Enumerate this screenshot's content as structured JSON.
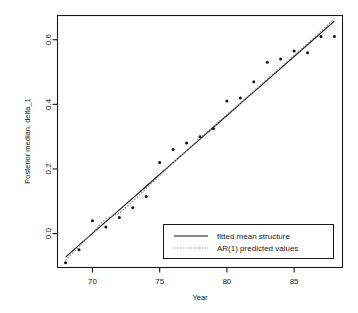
{
  "chart_data": {
    "type": "scatter",
    "title": "",
    "xlabel": "Year",
    "ylabel": "Posterior median, delta_1",
    "xlim": [
      67.4,
      88.6
    ],
    "ylim": [
      -0.105,
      0.675
    ],
    "xticks": [
      70,
      75,
      80,
      85
    ],
    "xticklabels": [
      "70",
      "75",
      "80",
      "85"
    ],
    "yticks": [
      0.0,
      0.2,
      0.4,
      0.6
    ],
    "yticklabels": [
      "0.0",
      "0.2",
      "0.4",
      "0.6"
    ],
    "grid": false,
    "legend_position": "bottom-right",
    "x": [
      68,
      69,
      70,
      71,
      72,
      73,
      74,
      75,
      76,
      77,
      78,
      79,
      80,
      81,
      82,
      83,
      84,
      85,
      86,
      87,
      88
    ],
    "series": [
      {
        "name": "Posterior median, delta_1",
        "kind": "points",
        "values": [
          -0.09,
          -0.05,
          0.04,
          0.02,
          0.05,
          0.08,
          0.115,
          0.22,
          0.26,
          0.28,
          0.3,
          0.325,
          0.41,
          0.42,
          0.47,
          0.53,
          0.54,
          0.565,
          0.56,
          0.61,
          0.61
        ]
      },
      {
        "name": "fitted mean structure",
        "kind": "line",
        "style": "solid",
        "color": "#111111",
        "values": [
          -0.073,
          -0.036,
          0.0005,
          0.037,
          0.0735,
          0.11,
          0.1465,
          0.183,
          0.2195,
          0.256,
          0.2925,
          0.329,
          0.3655,
          0.402,
          0.4385,
          0.475,
          0.5115,
          0.548,
          0.5845,
          0.621,
          0.6575
        ]
      },
      {
        "name": "AR(1) predicted values",
        "kind": "line",
        "style": "dotted",
        "color": "#8a8a8a",
        "values": [
          -0.083,
          -0.04,
          0.003,
          0.046,
          0.063,
          0.1,
          0.14,
          0.18,
          0.219,
          0.257,
          0.295,
          0.331,
          0.368,
          0.404,
          0.441,
          0.478,
          0.515,
          0.551,
          0.588,
          0.626,
          0.665
        ]
      }
    ],
    "legend": [
      {
        "label": "fitted mean structure",
        "style": "solid",
        "color": "#111111"
      },
      {
        "label": "AR(1) predicted values",
        "style": "dotted",
        "color": "#9a9a9a"
      }
    ]
  }
}
